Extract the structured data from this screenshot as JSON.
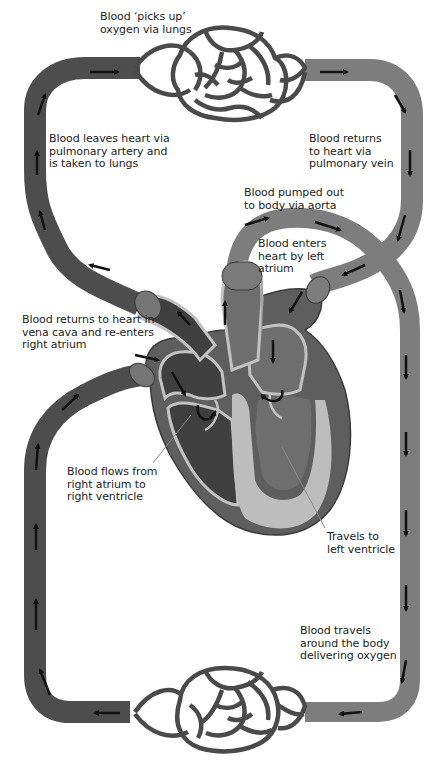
{
  "diagram": {
    "colors": {
      "deoxygenated_vessel": "#4d4d4d",
      "oxygenated_vessel": "#7d7d7d",
      "heart_right_side": "#444444",
      "heart_left_side": "#6e6e6e",
      "heart_wall": "#bdbdbd",
      "vessel_cuff": "#767676",
      "arrow": "#111111",
      "label_text": "#1e1e1e",
      "leader_line": "#8a8a8a",
      "background": "#ffffff"
    },
    "regions": {
      "lungs": "lung-capillary-network",
      "body": "body-capillary-network",
      "heart": "heart-cross-section"
    },
    "labels": [
      {
        "id": "lungs-oxygen",
        "text": "Blood ‘picks up’\noxygen via lungs"
      },
      {
        "id": "pulmonary-artery",
        "text": "Blood leaves heart via\npulmonary artery and\nis taken to lungs"
      },
      {
        "id": "pulmonary-vein",
        "text": "Blood returns\nto heart via\npulmonary vein"
      },
      {
        "id": "aorta",
        "text": "Blood pumped out\nto body via aorta"
      },
      {
        "id": "left-atrium",
        "text": "Blood enters\nheart by left\natrium"
      },
      {
        "id": "vena-cava",
        "text": "Blood returns to heart in\nvena cava and re-enters\nright atrium"
      },
      {
        "id": "right-ventricle",
        "text": "Blood flows from\nright atrium to\nright ventricle"
      },
      {
        "id": "left-ventricle",
        "text": "Travels to\nleft ventricle"
      },
      {
        "id": "body-oxygen",
        "text": "Blood travels\naround the body\ndelivering oxygen"
      }
    ],
    "flow_arrows": {
      "pulmonary_circuit": [
        "up left side",
        "right along top",
        "through lungs",
        "right then down right side",
        "into left atrium"
      ],
      "systemic_circuit": [
        "out aorta",
        "down right side",
        "left along bottom through body",
        "up left side",
        "into vena cava / right atrium"
      ]
    },
    "caption_visible": false
  }
}
